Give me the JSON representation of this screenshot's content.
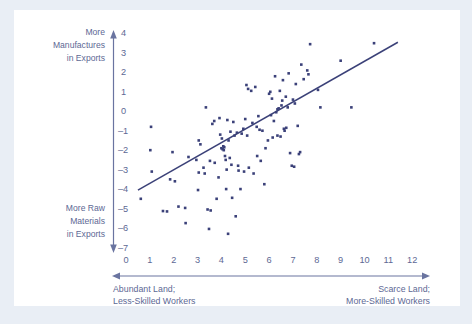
{
  "figure": {
    "background_color": "#e9eef5",
    "panel_color": "#ffffff",
    "ink_color": "#3b4179",
    "text_color": "#5d6894"
  },
  "labels": {
    "y_top_line1": "More",
    "y_top_line2": "Manufactures",
    "y_top_line3": "in Exports",
    "y_bottom_line1": "More Raw",
    "y_bottom_line2": "Materials",
    "y_bottom_line3": "in Exports",
    "caption_left_line1": "Abundant Land;",
    "caption_left_line2": "Less-Skilled Workers",
    "caption_right_line1": "Scarce Land;",
    "caption_right_line2": "More-Skilled Workers"
  },
  "chart_data": {
    "type": "scatter",
    "title": "",
    "xlabel": "Abundant Land; Less-Skilled Workers ↔ Scarce Land; More-Skilled Workers",
    "ylabel": "More Raw Materials in Exports ↔ More Manufactures in Exports",
    "xlim": [
      0,
      12
    ],
    "ylim": [
      -7,
      4
    ],
    "xticks": [
      0,
      1,
      2,
      3,
      4,
      5,
      6,
      7,
      8,
      9,
      10,
      11,
      12
    ],
    "xticklabels": [
      "0",
      "1",
      "2",
      "3",
      "4",
      "5",
      "6",
      "7",
      "8",
      "9",
      "10",
      "11",
      "12"
    ],
    "yticks": [
      4,
      3,
      2,
      1,
      0,
      -1,
      -2,
      -3,
      -4,
      -5,
      -6,
      -7
    ],
    "yticklabels": [
      "4",
      "3",
      "2",
      "1",
      "0",
      "–1",
      "–2",
      "–3",
      "–4",
      "–5",
      "–6",
      "–7"
    ],
    "grid": false,
    "legend": null,
    "marker": "square",
    "marker_size": 2.6,
    "trendline": {
      "type": "linear",
      "x": [
        0.5,
        11.4
      ],
      "y": [
        -4.1,
        3.5
      ],
      "slope": 0.697,
      "intercept": -4.449
    },
    "points": [
      [
        0.62,
        -4.55
      ],
      [
        1.05,
        -0.85
      ],
      [
        1.02,
        -2.05
      ],
      [
        1.08,
        -3.15
      ],
      [
        1.55,
        -5.18
      ],
      [
        1.72,
        -5.2
      ],
      [
        1.95,
        -2.15
      ],
      [
        1.85,
        -3.55
      ],
      [
        2.05,
        -3.65
      ],
      [
        2.48,
        -5.02
      ],
      [
        2.5,
        -5.8
      ],
      [
        2.62,
        -2.4
      ],
      [
        2.95,
        -2.55
      ],
      [
        3.02,
        -4.1
      ],
      [
        3.05,
        -3.2
      ],
      [
        3.12,
        -1.75
      ],
      [
        3.25,
        -2.95
      ],
      [
        3.3,
        -3.25
      ],
      [
        3.35,
        0.15
      ],
      [
        3.42,
        -5.1
      ],
      [
        3.55,
        -5.15
      ],
      [
        3.52,
        -2.6
      ],
      [
        3.48,
        -6.1
      ],
      [
        3.62,
        -0.7
      ],
      [
        3.7,
        -0.55
      ],
      [
        3.72,
        -2.7
      ],
      [
        3.8,
        -4.55
      ],
      [
        3.92,
        -0.4
      ],
      [
        3.95,
        -1.25
      ],
      [
        4.0,
        -1.95
      ],
      [
        4.05,
        -2.0
      ],
      [
        4.08,
        -1.85
      ],
      [
        4.1,
        -2.05
      ],
      [
        4.12,
        -1.9
      ],
      [
        4.15,
        -2.35
      ],
      [
        4.18,
        -2.55
      ],
      [
        4.2,
        -4.05
      ],
      [
        4.22,
        -3.05
      ],
      [
        4.25,
        -0.5
      ],
      [
        4.28,
        -6.35
      ],
      [
        4.3,
        -1.55
      ],
      [
        4.35,
        -2.45
      ],
      [
        4.38,
        -1.1
      ],
      [
        4.42,
        -2.8
      ],
      [
        4.45,
        -4.5
      ],
      [
        4.5,
        -0.6
      ],
      [
        4.55,
        -1.3
      ],
      [
        4.6,
        -5.45
      ],
      [
        4.65,
        -1.15
      ],
      [
        4.7,
        -2.85
      ],
      [
        4.72,
        -3.1
      ],
      [
        4.8,
        -4.05
      ],
      [
        4.85,
        -1.2
      ],
      [
        4.92,
        -0.95
      ],
      [
        5.0,
        -0.45
      ],
      [
        5.05,
        1.3
      ],
      [
        5.08,
        -1.3
      ],
      [
        5.15,
        -2.95
      ],
      [
        5.25,
        1.0
      ],
      [
        5.3,
        -0.65
      ],
      [
        5.35,
        -3.25
      ],
      [
        5.42,
        1.2
      ],
      [
        5.48,
        -0.85
      ],
      [
        5.55,
        -0.3
      ],
      [
        5.6,
        -1.0
      ],
      [
        5.65,
        -2.6
      ],
      [
        5.72,
        -1.05
      ],
      [
        5.8,
        -3.8
      ],
      [
        5.85,
        -1.95
      ],
      [
        5.95,
        -1.55
      ],
      [
        6.0,
        0.85
      ],
      [
        6.05,
        0.95
      ],
      [
        6.08,
        -0.25
      ],
      [
        6.12,
        0.6
      ],
      [
        6.15,
        -1.4
      ],
      [
        6.2,
        -0.55
      ],
      [
        6.25,
        1.75
      ],
      [
        6.3,
        -0.1
      ],
      [
        6.35,
        0.05
      ],
      [
        6.4,
        0.1
      ],
      [
        6.45,
        1.0
      ],
      [
        6.48,
        -1.35
      ],
      [
        6.52,
        0.25
      ],
      [
        6.55,
        0.5
      ],
      [
        6.58,
        1.55
      ],
      [
        6.62,
        -0.95
      ],
      [
        6.65,
        -1.05
      ],
      [
        6.7,
        0.7
      ],
      [
        6.72,
        -0.9
      ],
      [
        6.78,
        0.15
      ],
      [
        6.82,
        1.9
      ],
      [
        6.88,
        -2.2
      ],
      [
        6.95,
        -2.85
      ],
      [
        7.0,
        0.55
      ],
      [
        7.05,
        -2.9
      ],
      [
        7.08,
        0.35
      ],
      [
        7.12,
        1.35
      ],
      [
        7.2,
        -0.8
      ],
      [
        7.25,
        -2.25
      ],
      [
        7.3,
        -2.15
      ],
      [
        7.35,
        2.35
      ],
      [
        7.45,
        1.6
      ],
      [
        7.6,
        2.05
      ],
      [
        7.65,
        1.85
      ],
      [
        7.72,
        3.4
      ],
      [
        8.05,
        1.05
      ],
      [
        8.15,
        0.15
      ],
      [
        9.0,
        2.55
      ],
      [
        9.45,
        0.15
      ],
      [
        10.4,
        3.45
      ],
      [
        3.05,
        -1.55
      ],
      [
        4.02,
        -1.45
      ],
      [
        5.12,
        1.1
      ],
      [
        6.35,
        -1.3
      ],
      [
        2.2,
        -4.95
      ],
      [
        3.88,
        -3.45
      ],
      [
        4.95,
        -3.15
      ],
      [
        5.5,
        -2.35
      ]
    ]
  }
}
